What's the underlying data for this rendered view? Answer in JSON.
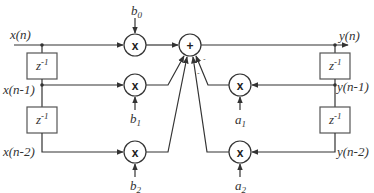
{
  "diagram": {
    "signals": {
      "input": "x(n)",
      "input_d1": "x(n-1)",
      "input_d2": "x(n-2)",
      "output": "y(n)",
      "output_d1": "y(n-1)",
      "output_d2": "y(n-2)"
    },
    "delay_label": {
      "base": "z",
      "exp": "-1"
    },
    "coefficients": {
      "b0": {
        "base": "b",
        "sub": "0"
      },
      "b1": {
        "base": "b",
        "sub": "1"
      },
      "b2": {
        "base": "b",
        "sub": "2"
      },
      "a1": {
        "base": "a",
        "sub": "1"
      },
      "a2": {
        "base": "a",
        "sub": "2"
      }
    },
    "operators": {
      "multiply": "x",
      "sum": "+"
    },
    "feedback_signs": [
      "-",
      "-"
    ]
  }
}
